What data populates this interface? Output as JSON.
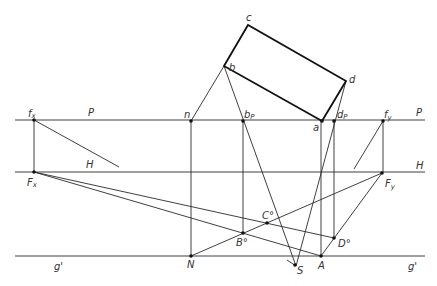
{
  "diagram": {
    "type": "perspective-construction",
    "lines": {
      "P": {
        "label": "P",
        "label_right": "P"
      },
      "H": {
        "label": "H",
        "label_right": "H"
      },
      "g": {
        "label": "g'",
        "label_right": "g'"
      }
    },
    "points": {
      "fx": {
        "label": "f",
        "sub": "x"
      },
      "Fx": {
        "label": "F",
        "sub": "x"
      },
      "fy": {
        "label": "f",
        "sub": "y"
      },
      "Fy": {
        "label": "F",
        "sub": "y"
      },
      "n": {
        "label": "n"
      },
      "N": {
        "label": "N"
      },
      "bP": {
        "label": "b",
        "sub": "P"
      },
      "dP": {
        "label": "d",
        "sub": "P"
      },
      "a": {
        "label": "a"
      },
      "b": {
        "label": "b"
      },
      "c": {
        "label": "c"
      },
      "d": {
        "label": "d"
      },
      "A": {
        "label": "A"
      },
      "B0": {
        "label": "B°"
      },
      "C0": {
        "label": "C°"
      },
      "D0": {
        "label": "D°"
      },
      "S": {
        "label": "S"
      }
    },
    "colors": {
      "stroke": "#2a2a2a",
      "heavy_stroke": "#111111",
      "background": "#ffffff"
    }
  }
}
